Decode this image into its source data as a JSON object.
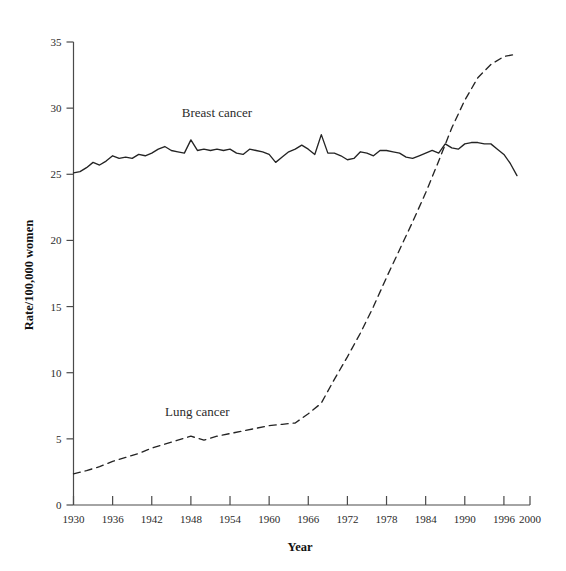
{
  "chart_data": {
    "type": "line",
    "title": "",
    "xlabel": "Year",
    "ylabel": "Rate/100,000 women",
    "xlim": [
      1930,
      2000
    ],
    "ylim": [
      0,
      35
    ],
    "grid": false,
    "legend_position": "inline-annotations",
    "x_ticks": [
      "1930",
      "1936",
      "1942",
      "1948",
      "1954",
      "1960",
      "1966",
      "1972",
      "1978",
      "1984",
      "1990",
      "1996",
      "2000"
    ],
    "x_tick_values": [
      1930,
      1936,
      1942,
      1948,
      1954,
      1960,
      1966,
      1972,
      1978,
      1984,
      1990,
      1996,
      2000
    ],
    "y_ticks": [
      "0",
      "5",
      "10",
      "15",
      "20",
      "25",
      "30",
      "35"
    ],
    "y_tick_values": [
      0,
      5,
      10,
      15,
      20,
      25,
      30,
      35
    ],
    "series": [
      {
        "name": "Breast cancer",
        "style": "solid",
        "color": "#242424",
        "label_x": 1952,
        "label_y": 29.3,
        "x": [
          1930,
          1931,
          1932,
          1933,
          1934,
          1935,
          1936,
          1937,
          1938,
          1939,
          1940,
          1941,
          1942,
          1943,
          1944,
          1945,
          1946,
          1947,
          1948,
          1949,
          1950,
          1951,
          1952,
          1953,
          1954,
          1955,
          1956,
          1957,
          1958,
          1959,
          1960,
          1961,
          1962,
          1963,
          1964,
          1965,
          1966,
          1967,
          1968,
          1969,
          1970,
          1971,
          1972,
          1973,
          1974,
          1975,
          1976,
          1977,
          1978,
          1979,
          1980,
          1981,
          1982,
          1983,
          1984,
          1985,
          1986,
          1987,
          1988,
          1989,
          1990,
          1991,
          1992,
          1993,
          1994,
          1995,
          1996,
          1997,
          1998
        ],
        "values": [
          25.1,
          25.2,
          25.5,
          25.9,
          25.7,
          26.0,
          26.4,
          26.2,
          26.3,
          26.2,
          26.5,
          26.4,
          26.6,
          26.9,
          27.1,
          26.8,
          26.7,
          26.6,
          27.6,
          26.8,
          26.9,
          26.8,
          26.9,
          26.8,
          26.9,
          26.6,
          26.5,
          26.9,
          26.8,
          26.7,
          26.5,
          25.9,
          26.3,
          26.7,
          26.9,
          27.2,
          26.9,
          26.5,
          28.0,
          26.6,
          26.6,
          26.4,
          26.1,
          26.2,
          26.7,
          26.6,
          26.4,
          26.8,
          26.8,
          26.7,
          26.6,
          26.3,
          26.2,
          26.4,
          26.6,
          26.8,
          26.6,
          27.3,
          27.0,
          26.9,
          27.3,
          27.4,
          27.4,
          27.3,
          27.3,
          26.9,
          26.5,
          25.8,
          24.9
        ]
      },
      {
        "name": "Lung cancer",
        "style": "dashed",
        "color": "#242424",
        "label_x": 1949,
        "label_y": 6.7,
        "x": [
          1930,
          1932,
          1934,
          1936,
          1938,
          1940,
          1942,
          1944,
          1946,
          1948,
          1950,
          1952,
          1954,
          1956,
          1958,
          1960,
          1962,
          1964,
          1966,
          1968,
          1970,
          1972,
          1974,
          1976,
          1978,
          1980,
          1982,
          1984,
          1986,
          1988,
          1990,
          1992,
          1994,
          1996,
          1998
        ],
        "values": [
          2.35,
          2.6,
          2.9,
          3.3,
          3.6,
          3.9,
          4.3,
          4.6,
          4.9,
          5.2,
          4.9,
          5.2,
          5.4,
          5.6,
          5.8,
          6.0,
          6.1,
          6.2,
          6.9,
          7.7,
          9.5,
          11.2,
          13.0,
          15.0,
          17.2,
          19.3,
          21.4,
          23.6,
          26.0,
          28.5,
          30.6,
          32.3,
          33.3,
          33.9,
          34.1
        ]
      }
    ]
  },
  "figure": {
    "breast_label": "Breast cancer",
    "lung_label": "Lung cancer",
    "x_axis_title": "Year",
    "y_axis_title": "Rate/100,000 women"
  }
}
